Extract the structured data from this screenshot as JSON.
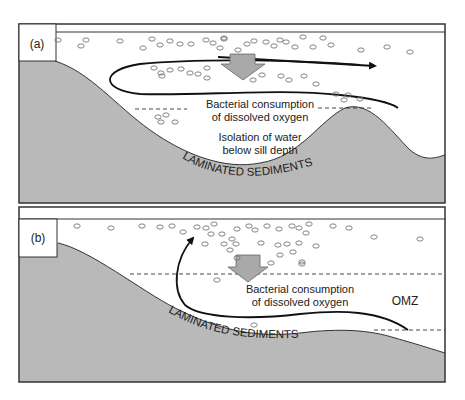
{
  "panels": [
    {
      "id": "a",
      "label": "(a)",
      "texts": {
        "consumption_line1": "Bacterial consumption",
        "consumption_line2": "of dissolved oxygen",
        "isolation_line1": "Isolation of water",
        "isolation_line2": "below sill depth",
        "sediments": "LAMINATED SEDIMENTS"
      }
    },
    {
      "id": "b",
      "label": "(b)",
      "texts": {
        "consumption_line1": "Bacterial consumption",
        "consumption_line2": "of dissolved oxygen",
        "omz": "OMZ",
        "sediments": "LAMINATED SEDIMENTS"
      }
    }
  ],
  "colors": {
    "sediment_fill": "#b9b9b9",
    "frame": "#333333",
    "arrow_fill": "#a9a9a9",
    "particle": "#777777"
  }
}
